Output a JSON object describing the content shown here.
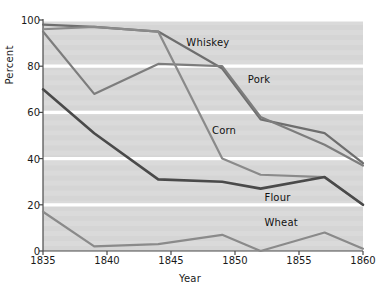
{
  "chart_data": {
    "type": "line",
    "title": "",
    "xlabel": "Year",
    "ylabel": "Percent",
    "xlim": [
      1835,
      1860
    ],
    "ylim": [
      0,
      100
    ],
    "xticks": [
      1835,
      1840,
      1845,
      1850,
      1855,
      1860
    ],
    "yticks": [
      0,
      20,
      40,
      60,
      80,
      100
    ],
    "grid": true,
    "gridlines": "horizontal-white",
    "legend": "inline-labels",
    "plot_background": "#d8d8d8",
    "x": [
      1835,
      1839,
      1844,
      1849,
      1852,
      1857,
      1860
    ],
    "series": [
      {
        "name": "Whiskey",
        "color": "#6e6e6e",
        "values": [
          98,
          97,
          95,
          79,
          57,
          51,
          38
        ],
        "label_x": 1846.2,
        "label_y": 90
      },
      {
        "name": "Pork",
        "color": "#7d7d7d",
        "values": [
          95,
          68,
          81,
          80,
          58,
          46,
          37
        ],
        "label_x": 1851.0,
        "label_y": 74
      },
      {
        "name": "Corn",
        "color": "#8a8a8a",
        "values": [
          96,
          97,
          95,
          40,
          33,
          32,
          20
        ],
        "label_x": 1848.2,
        "label_y": 52
      },
      {
        "name": "Flour",
        "color": "#4a4a4a",
        "values": [
          70,
          51,
          31,
          30,
          27,
          32,
          20
        ],
        "label_x": 1852.3,
        "label_y": 23
      },
      {
        "name": "Wheat",
        "color": "#8a8a8a",
        "values": [
          17,
          2,
          3,
          7,
          0,
          8,
          1
        ],
        "label_x": 1852.3,
        "label_y": 12
      }
    ]
  },
  "axes": {
    "xtick_labels": [
      "1835",
      "1840",
      "1845",
      "1850",
      "1855",
      "1860"
    ],
    "ytick_labels": [
      "0",
      "20",
      "40",
      "60",
      "80",
      "100"
    ],
    "xaxis_title": "Year",
    "yaxis_title": "Percent"
  }
}
